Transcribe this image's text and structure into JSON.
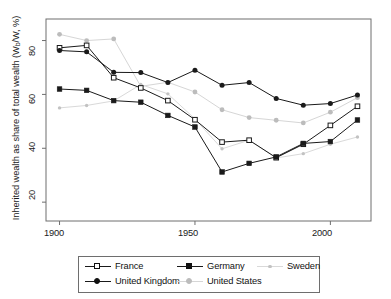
{
  "chart_data": {
    "type": "line",
    "title": "",
    "subtitle": "",
    "xlabel": "",
    "ylabel": "Inherited wealth as share of total wealth (Wb/W, %)",
    "ylabel_main": "Inherited wealth as share of total wealth (W",
    "ylabel_sub": "b",
    "ylabel_tail": "/W, %)",
    "x": [
      1900,
      1910,
      1920,
      1930,
      1940,
      1950,
      1960,
      1970,
      1980,
      1990,
      2000,
      2010
    ],
    "xlim": [
      1895,
      2015
    ],
    "ylim": [
      13,
      88
    ],
    "xticks": [
      1900,
      1950,
      2000
    ],
    "xtick_labels": [
      "1900",
      "1950",
      "2000"
    ],
    "yticks": [
      20,
      40,
      60,
      80
    ],
    "ytick_labels": [
      "20",
      "40",
      "60",
      "80"
    ],
    "grid": false,
    "legend_position": "bottom",
    "series": [
      {
        "name": "France",
        "marker": "open-square",
        "color": "#1a1a1a",
        "values": [
          77.3,
          78.2,
          66.2,
          62.4,
          57.7,
          50.6,
          42.3,
          43.0,
          36.5,
          41.5,
          48.5,
          55.6
        ]
      },
      {
        "name": "Germany",
        "marker": "filled-square",
        "color": "#1a1a1a",
        "values": [
          62.0,
          61.5,
          57.7,
          57.1,
          52.2,
          47.9,
          31.2,
          34.4,
          36.8,
          41.8,
          42.5,
          50.5
        ]
      },
      {
        "name": "Sweden",
        "marker": "small-dot",
        "color": "#c2c2c2",
        "values": [
          55.0,
          55.9,
          57.6,
          63.7,
          60.2,
          50.9,
          39.8,
          43.0,
          36.4,
          38.0,
          41.5,
          44.2
        ]
      },
      {
        "name": "United Kingdom",
        "marker": "filled-circle",
        "color": "#1a1a1a",
        "values": [
          76.3,
          75.8,
          68.2,
          68.1,
          64.4,
          69.0,
          63.4,
          64.4,
          58.5,
          56.0,
          56.6,
          59.8
        ]
      },
      {
        "name": "United States",
        "marker": "filled-circle-gray",
        "color": "#bcbcbc",
        "values": [
          82.3,
          80.0,
          80.6,
          63.0,
          64.5,
          60.9,
          54.3,
          51.4,
          50.4,
          49.4,
          53.4,
          58.8
        ]
      }
    ]
  },
  "legend": {
    "entries": [
      {
        "label": "France",
        "marker": "open-square",
        "color": "#1a1a1a"
      },
      {
        "label": "Germany",
        "marker": "filled-square",
        "color": "#1a1a1a"
      },
      {
        "label": "Sweden",
        "marker": "small-dot",
        "color": "#c2c2c2"
      },
      {
        "label": "United Kingdom",
        "marker": "filled-circle",
        "color": "#1a1a1a"
      },
      {
        "label": "United States",
        "marker": "filled-circle-gray",
        "color": "#bcbcbc"
      }
    ]
  },
  "axes": {
    "y_label_text": "Inherited wealth as share of total wealth (W",
    "y_label_sub": "b",
    "y_label_rest": "/W, %)",
    "ytick_0": "20",
    "ytick_1": "40",
    "ytick_2": "60",
    "ytick_3": "80",
    "xtick_0": "1900",
    "xtick_1": "1950",
    "xtick_2": "2000"
  },
  "colors": {
    "frame": "#6e6e6e",
    "dark_series": "#1a1a1a",
    "sweden_gray": "#c2c2c2",
    "us_gray": "#bcbcbc",
    "background": "#ffffff"
  }
}
